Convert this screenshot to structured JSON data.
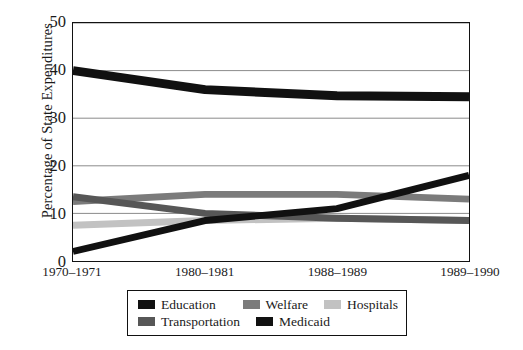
{
  "chart_data": {
    "type": "line",
    "title": "",
    "xlabel": "",
    "ylabel": "Percentage of State Expenditures",
    "categories": [
      "1970–1971",
      "1980–1981",
      "1988–1989",
      "1989–1990"
    ],
    "ylim": [
      0,
      50
    ],
    "yticks": [
      0,
      10,
      20,
      30,
      40,
      50
    ],
    "ytick_labels": [
      "0",
      "10",
      "20",
      "30",
      "40",
      "50"
    ],
    "grid": "horizontal",
    "legend_position": "bottom",
    "series": [
      {
        "name": "Education",
        "color": "#111111",
        "values": [
          40.0,
          36.0,
          34.7,
          34.5
        ],
        "thickness": 9
      },
      {
        "name": "Welfare",
        "color": "#7b7b7b",
        "values": [
          12.5,
          14.0,
          14.0,
          13.0
        ],
        "thickness": 7
      },
      {
        "name": "Hospitals",
        "color": "#c2c2c2",
        "values": [
          7.5,
          8.5,
          9.0,
          8.5
        ],
        "thickness": 7
      },
      {
        "name": "Transportation",
        "color": "#575757",
        "values": [
          13.5,
          10.0,
          9.0,
          8.5
        ],
        "thickness": 7
      },
      {
        "name": "Medicaid",
        "color": "#111111",
        "values": [
          2.0,
          8.5,
          11.0,
          18.0
        ],
        "thickness": 7
      }
    ]
  },
  "axes": {
    "y_title": "Percentage of State Expenditures",
    "y_tick_labels": [
      "50",
      "40",
      "30",
      "20",
      "10",
      "0"
    ],
    "x_tick_labels": [
      "1970–1971",
      "1980–1981",
      "1988–1989",
      "1989–1990"
    ]
  },
  "legend": {
    "row1": [
      {
        "label": "Education",
        "color": "#111111"
      },
      {
        "label": "Welfare",
        "color": "#7b7b7b"
      },
      {
        "label": "Hospitals",
        "color": "#c2c2c2"
      }
    ],
    "row2": [
      {
        "label": "Transportation",
        "color": "#575757"
      },
      {
        "label": "Medicaid",
        "color": "#111111"
      }
    ]
  },
  "colors": {
    "axis": "#121212",
    "grid": "#8a8a8a",
    "background": "#ffffff"
  }
}
